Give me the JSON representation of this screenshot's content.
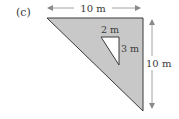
{
  "figure": {
    "part_label": "(c)",
    "top_dimension": "10 m",
    "right_dimension": "10 m",
    "hole_top_dimension": "2 m",
    "hole_side_dimension": "3 m",
    "shaded_color": "#c8c8c8",
    "line_color": "#3a3a3a",
    "arrow_color": "#8a8a8a"
  }
}
